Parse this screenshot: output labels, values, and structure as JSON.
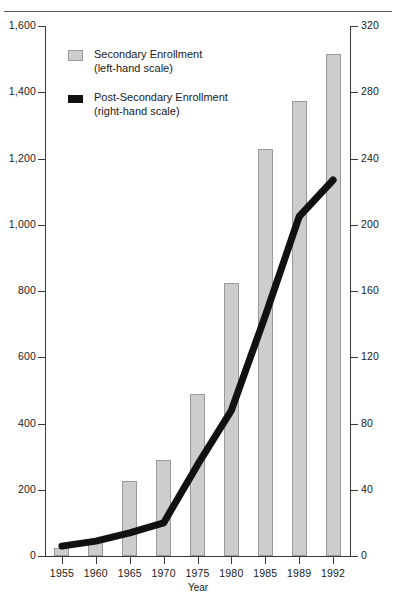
{
  "chart_data": {
    "type": "bar",
    "title": "",
    "xlabel": "Year",
    "ylabel": "",
    "categories": [
      "1955",
      "1960",
      "1965",
      "1970",
      "1975",
      "1980",
      "1985",
      "1989",
      "1992"
    ],
    "series": [
      {
        "name": "Secondary Enrollment",
        "scale": "left-hand scale",
        "render": "bar",
        "color": "#cdcdcd",
        "values": [
          25,
          50,
          225,
          290,
          490,
          825,
          1230,
          1375,
          1515
        ]
      },
      {
        "name": "Post-Secondary Enrollment",
        "scale": "right-hand scale",
        "render": "line",
        "color": "#111111",
        "values": [
          6,
          9,
          14,
          20,
          55,
          88,
          145,
          205,
          227
        ]
      }
    ],
    "left_axis": {
      "ticks": [
        "0",
        "200",
        "400",
        "600",
        "800",
        "1,000",
        "1,200",
        "1,400",
        "1,600"
      ],
      "tick_values": [
        0,
        200,
        400,
        600,
        800,
        1000,
        1200,
        1400,
        1600
      ],
      "ylim": [
        0,
        1600
      ]
    },
    "right_axis": {
      "ticks": [
        "0",
        "40",
        "80",
        "120",
        "160",
        "200",
        "240",
        "280",
        "320"
      ],
      "tick_values": [
        0,
        40,
        80,
        120,
        160,
        200,
        240,
        280,
        320
      ],
      "ylim": [
        0,
        320
      ]
    },
    "grid": false,
    "legend_position": "upper-left-inside"
  },
  "legend": {
    "items": [
      {
        "label": "Secondary Enrollment",
        "sub": "(left-hand scale)",
        "swatch": "bar-swatch"
      },
      {
        "label": "Post-Secondary Enrollment",
        "sub": "(right-hand scale)",
        "swatch": "line-swatch"
      }
    ]
  },
  "axis": {
    "x_title": "Year"
  }
}
